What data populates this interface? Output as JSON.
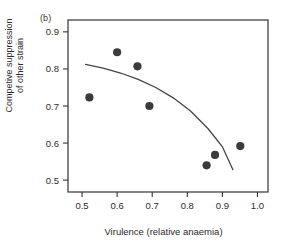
{
  "figure": {
    "panel_label": "(b)",
    "xlabel": "Virulence (relative anaemia)",
    "ylabel_line1": "Competive suppression",
    "ylabel_line2": "of other strain"
  },
  "chart_data": {
    "type": "scatter",
    "title": "",
    "panel": "(b)",
    "xlabel": "Virulence (relative anaemia)",
    "ylabel": "Competive suppression of other strain",
    "xlim": [
      0.46,
      1.03
    ],
    "ylim": [
      0.468,
      0.932
    ],
    "xticks": [
      0.5,
      0.6,
      0.7,
      0.8,
      0.9,
      1.0
    ],
    "xtick_labels": [
      "0.5",
      "0.6",
      "0.7",
      "0.8",
      "0.9",
      "1.0"
    ],
    "yticks": [
      0.5,
      0.6,
      0.7,
      0.8,
      0.9
    ],
    "ytick_labels": [
      "0.5",
      "0.6",
      "0.7",
      "0.8",
      "0.9"
    ],
    "grid": false,
    "legend": false,
    "marker_color": "#3b3b3b",
    "line_color": "#444444",
    "frame_color": "#333333",
    "series": [
      {
        "name": "observations",
        "type": "scatter",
        "x": [
          0.521,
          0.6,
          0.658,
          0.692,
          0.855,
          0.879,
          0.951
        ],
        "y": [
          0.723,
          0.845,
          0.807,
          0.7,
          0.54,
          0.568,
          0.592
        ]
      },
      {
        "name": "fitted curve",
        "type": "line",
        "x": [
          0.51,
          0.56,
          0.61,
          0.66,
          0.71,
          0.76,
          0.81,
          0.86,
          0.9,
          0.93
        ],
        "y": [
          0.812,
          0.802,
          0.789,
          0.772,
          0.75,
          0.722,
          0.686,
          0.638,
          0.59,
          0.528
        ]
      }
    ]
  }
}
